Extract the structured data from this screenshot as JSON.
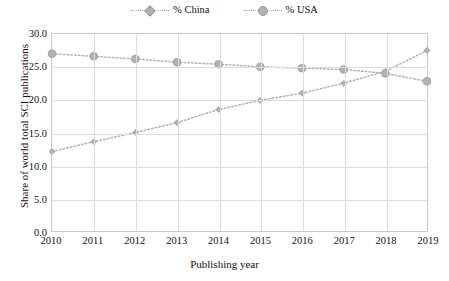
{
  "chart_data": {
    "type": "line",
    "title": "",
    "xlabel": "Publishing year",
    "ylabel": "Share of world total SCI publications",
    "categories": [
      "2010",
      "2011",
      "2012",
      "2013",
      "2014",
      "2015",
      "2016",
      "2017",
      "2018",
      "2019"
    ],
    "x": [
      2010,
      2011,
      2012,
      2013,
      2014,
      2015,
      2016,
      2017,
      2018,
      2019
    ],
    "xlim": [
      2010,
      2019
    ],
    "ylim": [
      0.0,
      30.0
    ],
    "ytick_labels": [
      "0.0",
      "5.0",
      "10.0",
      "15.0",
      "20.0",
      "25.0",
      "30.0"
    ],
    "yticks": [
      0.0,
      5.0,
      10.0,
      15.0,
      20.0,
      25.0,
      30.0
    ],
    "grid": "both",
    "legend_position": "top-center",
    "series": [
      {
        "name": "% China",
        "marker": "diamond",
        "linestyle": "dotted",
        "color": "#b2b2b2",
        "values": [
          12.1,
          13.6,
          15.0,
          16.5,
          18.5,
          19.9,
          21.0,
          22.5,
          24.3,
          27.5
        ]
      },
      {
        "name": "% USA",
        "marker": "circle",
        "linestyle": "dotted",
        "color": "#b2b2b2",
        "values": [
          27.0,
          26.6,
          26.2,
          25.7,
          25.4,
          25.0,
          24.8,
          24.6,
          24.0,
          22.8
        ]
      }
    ]
  },
  "legend": {
    "items": [
      {
        "label": "% China"
      },
      {
        "label": "% USA"
      }
    ]
  },
  "axes": {
    "x_title": "Publishing year",
    "y_title": "Share of world total SCI publications"
  },
  "colors": {
    "series": "#b2b2b2",
    "grid": "#dcdcdc",
    "frame": "#c9c9c9",
    "text": "#111111"
  }
}
